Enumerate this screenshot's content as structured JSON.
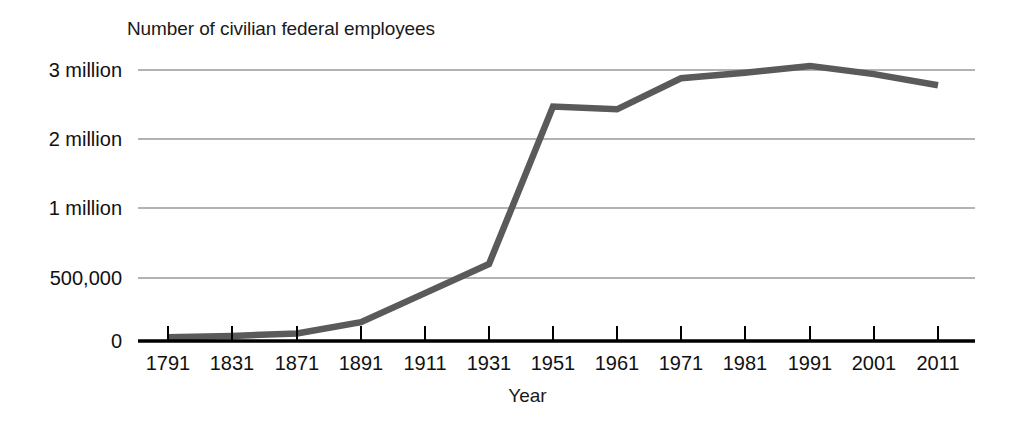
{
  "chart_data": {
    "type": "line",
    "title": "Number of civilian federal employees",
    "xlabel": "Year",
    "ylabel": "",
    "grid": true,
    "legend": false,
    "line_color": "#5a5a5a",
    "axis_color": "#000000",
    "grid_color": "#9a9a9a",
    "x": [
      1791,
      1831,
      1871,
      1891,
      1911,
      1931,
      1951,
      1961,
      1971,
      1981,
      1991,
      2001,
      2011
    ],
    "xtick_labels": [
      "1791",
      "1831",
      "1871",
      "1891",
      "1911",
      "1931",
      "1951",
      "1961",
      "1971",
      "1981",
      "1991",
      "2001",
      "2011"
    ],
    "values": [
      30000,
      40000,
      60000,
      150000,
      380000,
      600000,
      2470000,
      2430000,
      2880000,
      2960000,
      3060000,
      2940000,
      2780000
    ],
    "ytick_values": [
      0,
      500000,
      1000000,
      2000000,
      3000000
    ],
    "ytick_labels": [
      "0",
      "500,000",
      "1 million",
      "2 million",
      "3 million"
    ],
    "yaxis_note": "non-linear: ticks evenly spaced at 0, 500,000, 1 million, 2 million, 3 million",
    "ylim": [
      0,
      3000000
    ],
    "series_name": "Number of civilian federal employees"
  },
  "axis": {
    "x_title": "Year"
  },
  "ylabels": {
    "t0": "0",
    "t1": "500,000",
    "t2": "1 million",
    "t3": "2 million",
    "t4": "3 million"
  },
  "xlabels": {
    "t0": "1791",
    "t1": "1831",
    "t2": "1871",
    "t3": "1891",
    "t4": "1911",
    "t5": "1931",
    "t6": "1951",
    "t7": "1961",
    "t8": "1971",
    "t9": "1981",
    "t10": "1991",
    "t11": "2001",
    "t12": "2011"
  }
}
